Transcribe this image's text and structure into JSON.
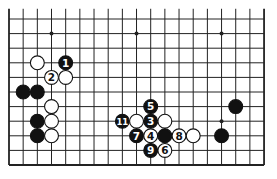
{
  "diagram": {
    "type": "go-board-partial",
    "board_size": 19,
    "visible_lines_from_bottom": 11,
    "edges": {
      "left": true,
      "right": true,
      "bottom": true,
      "top": false
    },
    "geometry": {
      "x0": 9,
      "dx": 14.17,
      "y_bottom": 165,
      "dy": 14.6
    },
    "colors": {
      "line": "#222222",
      "black": "#111111",
      "white": "#ffffff",
      "background": "#ffffff"
    },
    "star_points": [
      {
        "col": 3,
        "line": 4
      },
      {
        "col": 9,
        "line": 4
      },
      {
        "col": 15,
        "line": 4
      },
      {
        "col": 3,
        "line": 10
      },
      {
        "col": 9,
        "line": 10
      },
      {
        "col": 15,
        "line": 10
      }
    ],
    "stones": [
      {
        "color": "white",
        "col": 2,
        "line": 8,
        "label": ""
      },
      {
        "color": "black",
        "col": 4,
        "line": 8,
        "label": "1"
      },
      {
        "color": "white",
        "col": 3,
        "line": 7,
        "label": "2"
      },
      {
        "color": "white",
        "col": 4,
        "line": 7,
        "label": ""
      },
      {
        "color": "black",
        "col": 1,
        "line": 6,
        "label": ""
      },
      {
        "color": "black",
        "col": 2,
        "line": 6,
        "label": ""
      },
      {
        "color": "white",
        "col": 3,
        "line": 5,
        "label": ""
      },
      {
        "color": "black",
        "col": 2,
        "line": 4,
        "label": ""
      },
      {
        "color": "white",
        "col": 3,
        "line": 4,
        "label": ""
      },
      {
        "color": "black",
        "col": 2,
        "line": 3,
        "label": ""
      },
      {
        "color": "white",
        "col": 3,
        "line": 3,
        "label": ""
      },
      {
        "color": "black",
        "col": 10,
        "line": 5,
        "label": "5"
      },
      {
        "color": "black",
        "col": 8,
        "line": 4,
        "label": "11"
      },
      {
        "color": "white",
        "col": 9,
        "line": 4,
        "label": ""
      },
      {
        "color": "black",
        "col": 10,
        "line": 4,
        "label": "3"
      },
      {
        "color": "white",
        "col": 11,
        "line": 4,
        "label": ""
      },
      {
        "color": "black",
        "col": 9,
        "line": 3,
        "label": "7"
      },
      {
        "color": "white",
        "col": 10,
        "line": 3,
        "label": "4"
      },
      {
        "color": "black",
        "col": 11,
        "line": 3,
        "label": ""
      },
      {
        "color": "white",
        "col": 12,
        "line": 3,
        "label": "8"
      },
      {
        "color": "white",
        "col": 13,
        "line": 3,
        "label": ""
      },
      {
        "color": "black",
        "col": 10,
        "line": 2,
        "label": "9"
      },
      {
        "color": "white",
        "col": 11,
        "line": 2,
        "label": "6"
      },
      {
        "color": "black",
        "col": 16,
        "line": 5,
        "label": ""
      },
      {
        "color": "black",
        "col": 15,
        "line": 3,
        "label": ""
      }
    ]
  }
}
